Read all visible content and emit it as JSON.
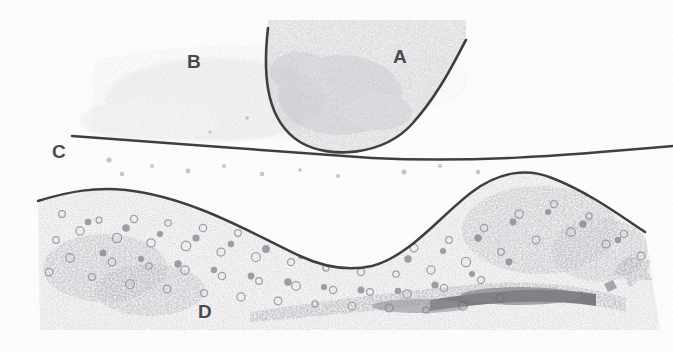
{
  "figure": {
    "kind": "histology-micrograph",
    "width": 673,
    "height": 352,
    "background_color": "#fefefe",
    "ink_color": "#4a4a4a",
    "line_color": "#3f3f3f",
    "stipple_color": "#9a9aa0",
    "dark_band_color": "#6d6d72"
  },
  "labels": [
    {
      "id": "A",
      "text": "A",
      "x": 393,
      "y": 57,
      "font_size": 19
    },
    {
      "id": "B",
      "text": "B",
      "x": 187,
      "y": 62,
      "font_size": 19
    },
    {
      "id": "C",
      "text": "C",
      "x": 52,
      "y": 152,
      "font_size": 19
    },
    {
      "id": "D",
      "text": "D",
      "x": 198,
      "y": 312,
      "font_size": 19
    }
  ],
  "structures": {
    "follicle_arc": {
      "name": "u-shaped-follicle-outline",
      "path": "M 268 28 C 262 80, 268 122, 300 142 C 330 160, 384 155, 412 124 C 440 93, 456 58, 466 40"
    },
    "boundary_line": {
      "name": "horizontal-tissue-boundary",
      "path": "M 72 136 C 160 142, 280 152, 372 158 C 470 163, 560 156, 673 146"
    },
    "wavy_line": {
      "name": "wavy-stromal-boundary",
      "path": "M 38 201 C 70 191, 96 187, 126 190 C 190 197, 250 232, 300 256 C 326 268, 350 271, 372 266 C 410 256, 440 216, 472 192 C 500 171, 528 168, 552 178 C 588 192, 618 214, 645 232"
    }
  },
  "textures": {
    "region_a_stipple": "fine dense stipple inside follicle",
    "region_b_stipple": "diffuse faint stipple above boundary",
    "region_d_cells": "round cell profiles of varied size",
    "dark_basal_band": "dark elongated stained band lower right",
    "dark_angular_blob": "dark star-shaped mark at right edge"
  }
}
